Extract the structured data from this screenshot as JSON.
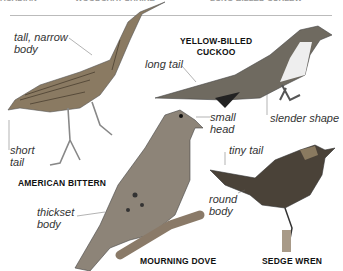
{
  "header_cut": {
    "left": "ACADIAN FLYCATCHER",
    "center": "WOODCHAT SHRIKE",
    "right": "LONG-BILLED CURLEW"
  },
  "birds": [
    {
      "name": "AMERICAN BITTERN",
      "labels": [
        "tall, narrow body",
        "short tail"
      ]
    },
    {
      "name_line1": "YELLOW-BILLED",
      "name_line2": "CUCKOO",
      "labels": [
        "long tail",
        "slender shape"
      ]
    },
    {
      "name": "MOURNING DOVE",
      "labels": [
        "small head",
        "thickset body"
      ]
    },
    {
      "name": "SEDGE WREN",
      "labels": [
        "tiny tail",
        "round body"
      ]
    }
  ],
  "text": {
    "tall": "tall, narrow",
    "body1": "body",
    "short": "short",
    "tail1": "tail",
    "long_tail": "long tail",
    "small": "small",
    "head": "head",
    "slender": "slender shape",
    "thickset": "thickset",
    "body2": "body",
    "tiny_tail": "tiny tail",
    "round": "round",
    "body3": "body",
    "n_bittern": "AMERICAN BITTERN",
    "n_cuckoo1": "YELLOW-BILLED",
    "n_cuckoo2": "CUCKOO",
    "n_dove": "MOURNING DOVE",
    "n_wren": "SEDGE WREN"
  }
}
